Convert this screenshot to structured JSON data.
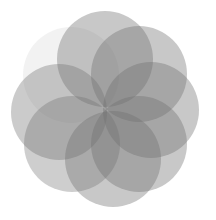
{
  "figure": {
    "width": 216,
    "height": 220,
    "background": "#ffffff",
    "fill_color": "#6e6e6e",
    "circles": [
      {
        "name": "circle-top-left",
        "cx": 71,
        "cy": 75,
        "r": 48,
        "opacity": 0.09
      },
      {
        "name": "circle-top",
        "cx": 105,
        "cy": 59,
        "r": 48,
        "opacity": 0.38
      },
      {
        "name": "circle-top-right",
        "cx": 139,
        "cy": 74,
        "r": 48,
        "opacity": 0.38
      },
      {
        "name": "circle-right",
        "cx": 151,
        "cy": 110,
        "r": 48,
        "opacity": 0.38
      },
      {
        "name": "circle-bottom-right",
        "cx": 139,
        "cy": 144,
        "r": 48,
        "opacity": 0.38
      },
      {
        "name": "circle-bottom",
        "cx": 113,
        "cy": 159,
        "r": 48,
        "opacity": 0.38
      },
      {
        "name": "circle-bottom-left",
        "cx": 72,
        "cy": 144,
        "r": 48,
        "opacity": 0.34
      },
      {
        "name": "circle-left",
        "cx": 59,
        "cy": 112,
        "r": 48,
        "opacity": 0.36
      }
    ]
  }
}
